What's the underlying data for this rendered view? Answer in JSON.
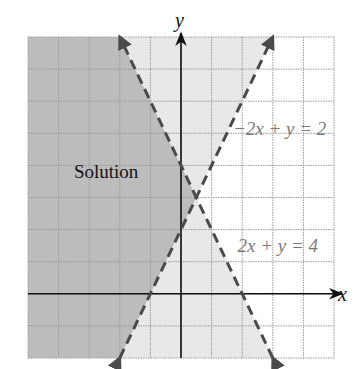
{
  "chart_data": {
    "type": "line",
    "title": "",
    "xlabel": "x",
    "ylabel": "y",
    "xlim": [
      -5,
      5
    ],
    "ylim": [
      -2,
      8
    ],
    "grid": true,
    "grid_step": 1,
    "tick_labels_shown": false,
    "series": [
      {
        "name": "2x + y = 4",
        "label": "2x + y = 4",
        "equation": "y = 4 - 2x",
        "slope": -2,
        "intercept": 4,
        "style": "dashed",
        "inequality": "2x + y < 4",
        "points": [
          [
            -2,
            8
          ],
          [
            3,
            -2
          ]
        ]
      },
      {
        "name": "-2x + y = 2",
        "label": "−2x + y = 2",
        "equation": "y = 2 + 2x",
        "slope": 2,
        "intercept": 2,
        "style": "dashed",
        "inequality": "-2x + y > 2",
        "points": [
          [
            3,
            8
          ],
          [
            -2,
            -2
          ]
        ]
      }
    ],
    "intersection": [
      0.5,
      3
    ],
    "regions": [
      {
        "name": "solution",
        "description": "satisfies both inequalities",
        "shade": "dark"
      },
      {
        "name": "top-wedge",
        "description": "satisfies -2x + y > 2 only",
        "shade": "light"
      },
      {
        "name": "bottom-wedge",
        "description": "satisfies 2x + y < 4 only",
        "shade": "light"
      },
      {
        "name": "right-region",
        "description": "satisfies neither",
        "shade": "none"
      }
    ],
    "annotations": [
      {
        "text": "Solution",
        "x": -3.5,
        "y": 3.6,
        "color": "#111111"
      },
      {
        "text": "−2x + y = 2",
        "x": 1.7,
        "y": 4.95,
        "color": "#7a7a7a"
      },
      {
        "text": "2x + y = 4",
        "x": 1.85,
        "y": 1.3,
        "color": "#7a7a7a"
      }
    ]
  },
  "colors": {
    "dark_fill": "#bcbcbc",
    "light_fill": "#e8e8e8",
    "grid": "#9a9a9a",
    "axis": "#111111",
    "boundary": "#4a4a4a",
    "label_gray": "#7a7a7a",
    "text": "#111111"
  }
}
